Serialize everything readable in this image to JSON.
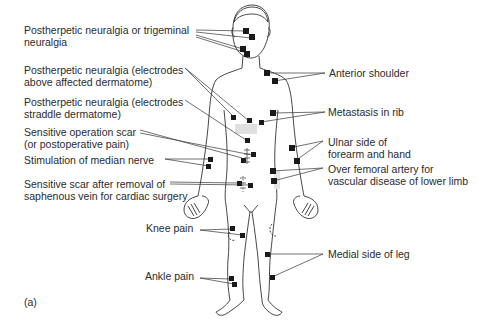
{
  "figure": {
    "panel_label": "(a)"
  },
  "labels": {
    "left": [
      {
        "id": "trigeminal",
        "text": "Postherpetic neuralgia or trigeminal\nneuralgia"
      },
      {
        "id": "ph_above",
        "text": "Postherpetic neuralgia (electrodes\nabove affected dermatome)"
      },
      {
        "id": "ph_straddle",
        "text": "Postherpetic neuralgia (electrodes\nstraddle dermatome)"
      },
      {
        "id": "op_scar",
        "text": "Sensitive operation scar\n(or postoperative pain)"
      },
      {
        "id": "median",
        "text": "Stimulation of median nerve"
      },
      {
        "id": "saphenous",
        "text": "Sensitive scar after removal of\nsaphenous vein for cardiac surgery"
      },
      {
        "id": "knee",
        "text": "Knee pain"
      },
      {
        "id": "ankle",
        "text": "Ankle pain"
      }
    ],
    "right": [
      {
        "id": "shoulder",
        "text": "Anterior shoulder"
      },
      {
        "id": "rib",
        "text": "Metastasis in rib"
      },
      {
        "id": "ulnar",
        "text": "Ulnar side of\nforearm and hand"
      },
      {
        "id": "femoral",
        "text": "Over femoral artery for\nvascular disease of lower limb"
      },
      {
        "id": "medial_leg",
        "text": "Medial side of leg"
      }
    ]
  }
}
